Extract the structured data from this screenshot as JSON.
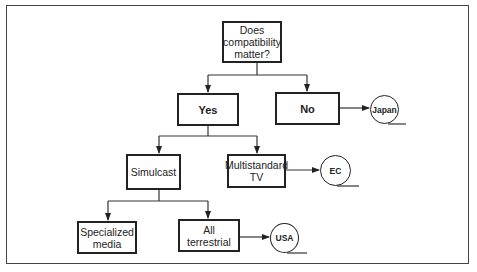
{
  "diagram": {
    "type": "decision-tree",
    "nodes": {
      "root": {
        "label": "Does compatibility matter?",
        "lines": [
          "Does",
          "compatibility",
          "matter?"
        ]
      },
      "yes": {
        "label": "Yes"
      },
      "no": {
        "label": "No"
      },
      "simulcast": {
        "label": "Simulcast"
      },
      "multistandard": {
        "label": "Multistandard TV",
        "lines": [
          "Multistandard",
          "TV"
        ]
      },
      "specialized": {
        "label": "Specialized media",
        "lines": [
          "Specialized",
          "media"
        ]
      },
      "terrestrial": {
        "label": "All terrestrial",
        "lines": [
          "All",
          "terrestrial"
        ]
      }
    },
    "terminals": {
      "japan": {
        "label": "Japan"
      },
      "ec": {
        "label": "EC"
      },
      "usa": {
        "label": "USA"
      }
    },
    "edges": [
      {
        "from": "root",
        "to": "yes"
      },
      {
        "from": "root",
        "to": "no"
      },
      {
        "from": "no",
        "to": "japan"
      },
      {
        "from": "yes",
        "to": "simulcast"
      },
      {
        "from": "yes",
        "to": "multistandard"
      },
      {
        "from": "multistandard",
        "to": "ec"
      },
      {
        "from": "simulcast",
        "to": "specialized"
      },
      {
        "from": "simulcast",
        "to": "terrestrial"
      },
      {
        "from": "terrestrial",
        "to": "usa"
      }
    ]
  }
}
